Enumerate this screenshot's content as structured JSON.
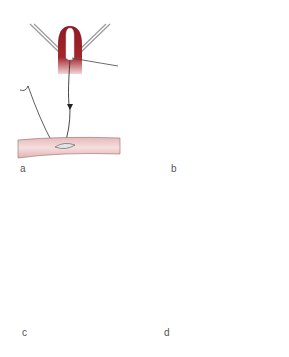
{
  "figure": {
    "panels": [
      {
        "id": "a",
        "label": "a"
      },
      {
        "id": "b",
        "label": "b"
      },
      {
        "id": "c",
        "label": "c"
      },
      {
        "id": "d",
        "label": "d"
      }
    ],
    "colors": {
      "tissue_dark": "#8e1b22",
      "tissue_light": "#f3d6d6",
      "vessel_fill": "#f0cfcf",
      "vessel_stroke": "#8a5a5a",
      "instrument": "#9a9a9a",
      "suture": "#333333",
      "incision_fill": "#dde3e6"
    }
  }
}
